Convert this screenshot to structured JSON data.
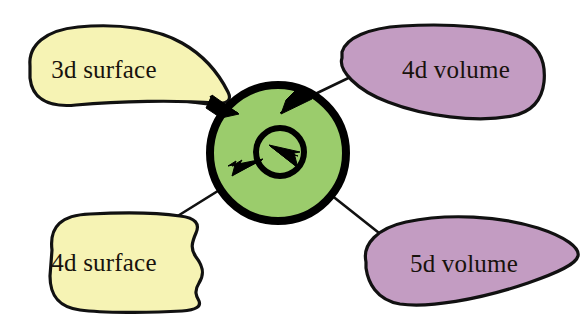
{
  "diagram": {
    "type": "concept-callout-diagram",
    "width": 587,
    "height": 319,
    "background_color": "#ffffff",
    "title": "",
    "center": {
      "name": "core",
      "shape": "concentric-circles",
      "fill_color": "#9bcc6c",
      "stroke_color": "#000000",
      "label": "",
      "outer": {
        "cx": 278,
        "cy": 153,
        "r": 68,
        "stroke_width": 8
      },
      "inner": {
        "cx": 280,
        "cy": 152,
        "r": 24,
        "stroke_width": 6
      }
    },
    "callouts": [
      {
        "id": "3d-surface",
        "label": "3d surface",
        "fill_color": "#f6f3b4",
        "category": "surface",
        "position": "top-left",
        "arrow": "points-to-core-outer-edge",
        "text_x": 104,
        "text_y": 72
      },
      {
        "id": "4d-volume",
        "label": "4d volume",
        "fill_color": "#c39cc2",
        "category": "volume",
        "position": "top-right",
        "arrow": "points-to-core-interior",
        "text_x": 455,
        "text_y": 72
      },
      {
        "id": "4d-surface",
        "label": "4d surface",
        "fill_color": "#f6f3b4",
        "category": "surface",
        "position": "bottom-left",
        "arrow": "points-to-core-interior",
        "text_x": 104,
        "text_y": 265
      },
      {
        "id": "5d-volume",
        "label": "5d volume",
        "fill_color": "#c39cc2",
        "category": "volume",
        "position": "bottom-right",
        "arrow": "points-to-core-inner-circle",
        "text_x": 462,
        "text_y": 265
      }
    ],
    "colors": {
      "yellow": "#f6f3b4",
      "purple": "#c39cc2",
      "green": "#9bcc6c",
      "outline": "#111111",
      "text": "#18120c"
    }
  }
}
